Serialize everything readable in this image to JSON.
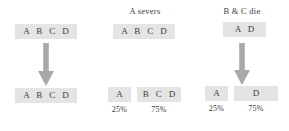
{
  "diagram": {
    "colors": {
      "box_fill": "#e4e4e4",
      "arrow_fill": "#a9a9a9",
      "text": "#3b3b3b",
      "background": "#ffffff"
    },
    "columns": [
      {
        "id": "no-break",
        "caption": "",
        "top_box": "A B C D",
        "arrow": "down-arrow",
        "bottom_boxes": [
          {
            "label": "A B C D",
            "percent": ""
          }
        ]
      },
      {
        "id": "a-severs",
        "caption": "A severs",
        "top_box": "A B C D",
        "arrow": "down-arrow",
        "bottom_boxes": [
          {
            "label": "A",
            "percent": "25%"
          },
          {
            "label": "B C D",
            "percent": "75%"
          }
        ]
      },
      {
        "id": "b-and-c-die",
        "caption": "B & C die",
        "top_box": "A D",
        "arrow": "down-arrow",
        "bottom_boxes": [
          {
            "label": "A",
            "percent": "25%"
          },
          {
            "label": "D",
            "percent": "75%"
          }
        ]
      }
    ]
  }
}
